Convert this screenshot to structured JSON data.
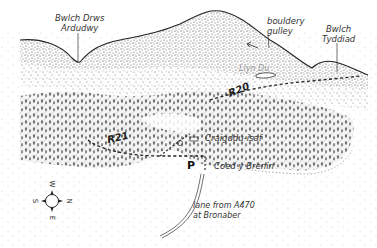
{
  "map": {
    "labels": {
      "pass_west": "Bwlch Drws\nArdudwy",
      "pass_west_line1": "Bwlch Drws",
      "pass_west_line2": "Ardudwy",
      "gully_line1": "bouldery",
      "gully_line2": "gulley",
      "pass_east_line1": "Bwlch",
      "pass_east_line2": "Tyddiad",
      "lake": "Llyn Du",
      "farm": "Craigddu-isaf",
      "forest": "Coed y Brenin",
      "lane_line1": "lane from  A470",
      "lane_line2": "at Bronaber"
    },
    "routes": [
      {
        "id": "R20",
        "label": "R20"
      },
      {
        "id": "R21",
        "label": "R21"
      }
    ],
    "symbols": {
      "parking": "P"
    },
    "compass": {
      "top": "W",
      "right": "N",
      "bottom": "E",
      "left": "S"
    },
    "colors": {
      "ink": "#222222",
      "stipple": "#555555",
      "lake_text": "#9a9a9a",
      "background": "#ffffff"
    }
  }
}
